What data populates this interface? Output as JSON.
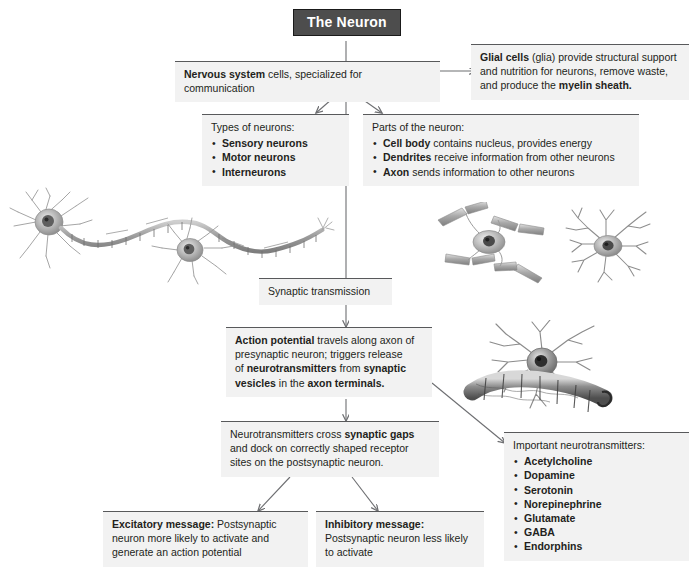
{
  "title": {
    "label": "The Neuron"
  },
  "boxes": {
    "nervous_system": {
      "name": "nervous-system-cells",
      "line1_bold": "Nervous system",
      "line1_rest": " cells, specialized for communication"
    },
    "glial": {
      "name": "glial-cells",
      "l1_b": "Glial cells",
      "l1_r": " (glia) provide structural support",
      "l2": "and nutrition for neurons, remove waste,",
      "l3_r": "and produce the ",
      "l3_b": "myelin sheath."
    },
    "types": {
      "heading": "Types of neurons:",
      "items": [
        "Sensory neurons",
        "Motor neurons",
        "Interneurons"
      ]
    },
    "parts": {
      "heading": "Parts of the neuron:",
      "items": [
        {
          "bold": "Cell body",
          "rest": " contains nucleus, provides energy"
        },
        {
          "bold": "Dendrites",
          "rest": " receive information from other neurons"
        },
        {
          "bold": "Axon",
          "rest": " sends information to other neurons"
        }
      ]
    },
    "synaptic_transmission": {
      "label": "Synaptic transmission"
    },
    "action_potential": {
      "l1_b": "Action potential",
      "l1_r": " travels along axon of",
      "l2": "presynaptic neuron; triggers release",
      "l3_r1": "of ",
      "l3_b1": "neurotransmitters",
      "l3_r2": " from ",
      "l3_b2": "synaptic",
      "l4_b1": "vesicles",
      "l4_r1": " in the ",
      "l4_b2": "axon terminals."
    },
    "cross_gaps": {
      "l1_r": "Neurotransmitters cross ",
      "l1_b": "synaptic gaps",
      "l2": "and dock on correctly shaped receptor",
      "l3": "sites on the postsynaptic neuron."
    },
    "excitatory": {
      "l1_b": "Excitatory message:",
      "l1_r": " Postsynaptic",
      "l2": "neuron more likely to activate and",
      "l3": "generate an action potential"
    },
    "inhibitory": {
      "l1_b": "Inhibitory message:",
      "l2": "Postsynaptic neuron less likely",
      "l3": "to activate"
    },
    "important_nt": {
      "heading": "Important neurotransmitters:",
      "items": [
        "Acetylcholine",
        "Dopamine",
        "Serotonin",
        "Norepinephrine",
        "Glutamate",
        "GABA",
        "Endorphins"
      ]
    }
  },
  "colors": {
    "box_bg": "#f2f2f2",
    "box_border": "#58595b",
    "title_bg": "#4d4d4d",
    "title_text": "#ffffff",
    "text": "#231f20",
    "connector": "#6d6e71"
  },
  "illustrations": [
    {
      "name": "myelinated-neuron-chain-illustration"
    },
    {
      "name": "bipolar-neuron-illustration"
    },
    {
      "name": "multipolar-star-neuron-illustration"
    },
    {
      "name": "neuron-with-myelin-sheath-illustration"
    }
  ]
}
